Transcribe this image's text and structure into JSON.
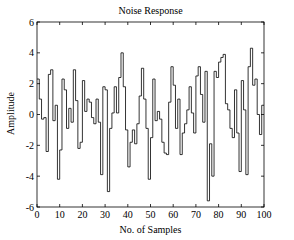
{
  "chart_data": {
    "type": "line",
    "style": "stairs",
    "title": "Noise Response",
    "xlabel": "No. of Samples",
    "ylabel": "Amplitude",
    "xlim": [
      0,
      100
    ],
    "ylim": [
      -6,
      6
    ],
    "xticks": [
      0,
      10,
      20,
      30,
      40,
      50,
      60,
      70,
      80,
      90,
      100
    ],
    "yticks": [
      -6,
      -4,
      -2,
      0,
      2,
      4,
      6
    ],
    "grid": false,
    "legend": null,
    "series": [
      {
        "name": "noise",
        "x": [
          0,
          1,
          2,
          3,
          4,
          5,
          6,
          7,
          8,
          9,
          10,
          11,
          12,
          13,
          14,
          15,
          16,
          17,
          18,
          19,
          20,
          21,
          22,
          23,
          24,
          25,
          26,
          27,
          28,
          29,
          30,
          31,
          32,
          33,
          34,
          35,
          36,
          37,
          38,
          39,
          40,
          41,
          42,
          43,
          44,
          45,
          46,
          47,
          48,
          49,
          50,
          51,
          52,
          53,
          54,
          55,
          56,
          57,
          58,
          59,
          60,
          61,
          62,
          63,
          64,
          65,
          66,
          67,
          68,
          69,
          70,
          71,
          72,
          73,
          74,
          75,
          76,
          77,
          78,
          79,
          80,
          81,
          82,
          83,
          84,
          85,
          86,
          87,
          88,
          89,
          90,
          91,
          92,
          93,
          94,
          95,
          96,
          97,
          98,
          99
        ],
        "values": [
          2.3,
          1.0,
          -0.3,
          -0.2,
          -2.4,
          2.6,
          2.9,
          -0.4,
          0.6,
          -4.2,
          -2.3,
          2.3,
          1.6,
          -0.9,
          0.4,
          -0.5,
          2.9,
          0.9,
          -2.2,
          -1.8,
          2.2,
          0.2,
          1.0,
          0.8,
          -0.2,
          -0.6,
          1.0,
          -0.5,
          -3.9,
          1.8,
          1.6,
          -5.0,
          -0.9,
          0.1,
          1.8,
          0.1,
          2.4,
          4.0,
          1.8,
          -1.0,
          -3.4,
          -1.8,
          -1.0,
          -1.9,
          -0.6,
          1.2,
          3.0,
          1.0,
          -0.9,
          -4.2,
          -1.5,
          2.3,
          -0.4,
          0.2,
          -0.3,
          -1.8,
          -2.5,
          -2.6,
          0.8,
          3.1,
          1.9,
          -0.9,
          1.0,
          -2.6,
          -1.2,
          -0.6,
          0.3,
          1.8,
          0.1,
          -1.2,
          2.5,
          3.1,
          1.3,
          -0.5,
          2.8,
          -5.6,
          -1.9,
          -4.0,
          2.8,
          2.4,
          3.4,
          3.7,
          3.9,
          0.7,
          0.3,
          -0.9,
          -1.5,
          1.6,
          -1.2,
          -3.7,
          2.2,
          0.3,
          -3.9,
          3.1,
          4.3,
          1.9,
          2.3,
          0.0,
          -1.3,
          0.6
        ]
      }
    ]
  },
  "plot_area": {
    "left": 37,
    "top": 22,
    "right": 264,
    "bottom": 207
  },
  "colors": {
    "line": "#000000",
    "axes": "#000000",
    "background": "#ffffff"
  }
}
